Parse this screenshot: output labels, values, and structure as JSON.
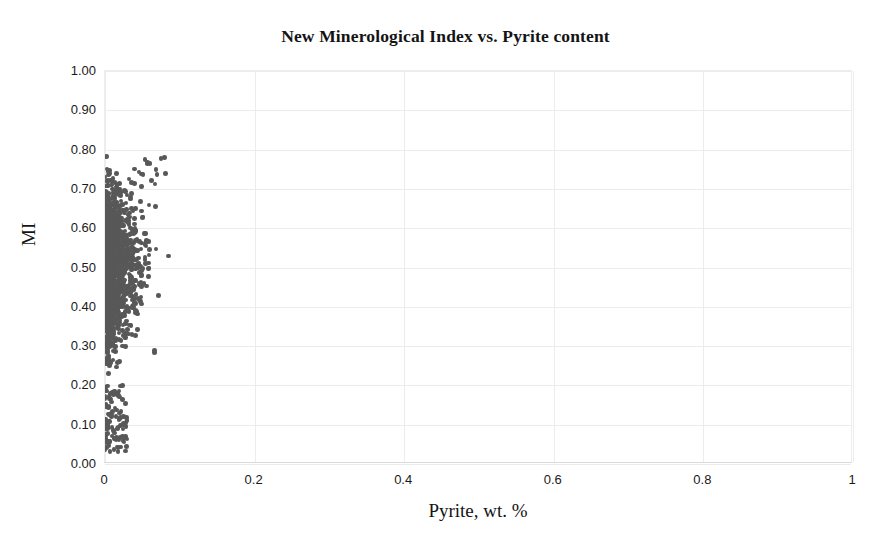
{
  "chart_data": {
    "type": "scatter",
    "title": "New Minerological Index vs. Pyrite content",
    "xlabel": "Pyrite, wt. %",
    "ylabel": "MI",
    "xlim": [
      0,
      1
    ],
    "ylim": [
      0,
      1
    ],
    "grid": true,
    "legend": false,
    "marker": {
      "shape": "circle",
      "color": "#585858",
      "size_px": 4.6
    },
    "xticks": [
      0,
      0.2,
      0.4,
      0.6,
      0.8,
      1
    ],
    "xtick_labels": [
      "0",
      "0.2",
      "0.4",
      "0.6",
      "0.8",
      "1"
    ],
    "yticks": [
      0.0,
      0.1,
      0.2,
      0.3,
      0.4,
      0.5,
      0.6,
      0.7,
      0.8,
      0.9,
      1.0
    ],
    "ytick_labels": [
      "0.00",
      "0.10",
      "0.20",
      "0.30",
      "0.40",
      "0.50",
      "0.60",
      "0.70",
      "0.80",
      "0.90",
      "1.00"
    ],
    "series": [
      {
        "name": "Samples",
        "color": "#585858",
        "x_range": [
          0.0,
          0.09
        ],
        "y_range": [
          0.03,
          0.8
        ],
        "n_points": 1600,
        "distribution": {
          "main_cluster": {
            "y_min": 0.2,
            "y_max": 0.8,
            "x_max_at_core": 0.018,
            "x_tail_max": 0.085,
            "fraction": 0.93
          },
          "low_tail": {
            "y_min": 0.03,
            "y_max": 0.2,
            "x_max": 0.03,
            "fraction": 0.07
          },
          "outlier_group_upper": {
            "y_min": 0.7,
            "y_max": 0.78,
            "x_min": 0.035,
            "x_max": 0.085
          }
        }
      }
    ]
  }
}
